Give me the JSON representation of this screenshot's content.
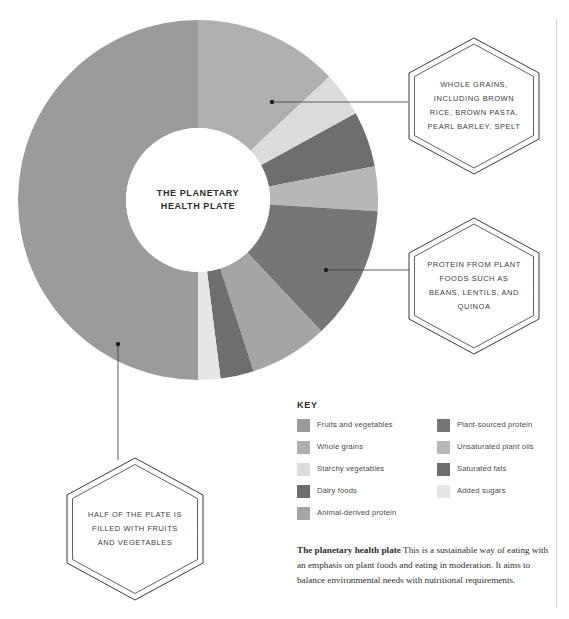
{
  "page": {
    "center_label": "THE PLANETARY\nHEALTH PLATE"
  },
  "callouts": [
    {
      "id": "whole-grains",
      "text": "WHOLE GRAINS,\nINCLUDING BROWN\nRICE, BROWN PASTA,\nPEARL BARLEY, SPELT"
    },
    {
      "id": "plant-protein",
      "text": "PROTEIN FROM PLANT\nFOODS SUCH AS\nBEANS, LENTILS, AND\nQUINOA"
    },
    {
      "id": "fruits-vegetables",
      "text": "HALF OF THE PLATE IS\nFILLED WITH FRUITS\nAND VEGETABLES"
    }
  ],
  "key": {
    "title": "KEY",
    "left_column": [
      {
        "label": "Fruits and vegetables",
        "color": "#9b9b9b"
      },
      {
        "label": "Whole grains",
        "color": "#b0b0b0"
      },
      {
        "label": "Starchy vegetables",
        "color": "#dcdcdc"
      },
      {
        "label": "Dairy foods",
        "color": "#6e6e6e"
      },
      {
        "label": "Animal-derived protein",
        "color": "#a5a5a5"
      }
    ],
    "right_column": [
      {
        "label": "Plant-sourced protein",
        "color": "#767676"
      },
      {
        "label": "Unsaturated plant oils",
        "color": "#b7b7b7"
      },
      {
        "label": "Saturated fats",
        "color": "#6e6e6e"
      },
      {
        "label": "Added sugars",
        "color": "#e6e6e6"
      }
    ]
  },
  "caption": {
    "lead": "The planetary health plate",
    "body": "This is a sustainable way of eating with an emphasis on plant foods and eating in moderation. It aims to balance environmental needs with nutritional requirements."
  },
  "chart_data": {
    "type": "pie",
    "title": "The planetary health plate",
    "subtitle": "",
    "xlabel": "",
    "ylabel": "",
    "donut": true,
    "inner_radius_ratio": 0.4,
    "start_angle_deg": 0,
    "direction": "clockwise",
    "legend_position": "bottom-right",
    "grid": false,
    "units": "percent of plate",
    "categories": [
      "Whole grains",
      "Starchy vegetables",
      "Dairy foods",
      "Unsaturated plant oils",
      "Plant-sourced protein",
      "Animal-derived protein",
      "Saturated fats",
      "Added sugars",
      "Fruits and vegetables"
    ],
    "values": [
      13,
      4,
      5,
      4,
      12,
      7,
      3,
      2,
      50
    ],
    "colors": [
      "#b0b0b0",
      "#dcdcdc",
      "#6e6e6e",
      "#b7b7b7",
      "#767676",
      "#a5a5a5",
      "#6e6e6e",
      "#e6e6e6",
      "#9b9b9b"
    ],
    "annotations": [
      "WHOLE GRAINS, INCLUDING BROWN RICE, BROWN PASTA, PEARL BARLEY, SPELT",
      "PROTEIN FROM PLANT FOODS SUCH AS BEANS, LENTILS, AND QUINOA",
      "HALF OF THE PLATE IS FILLED WITH FRUITS AND VEGETABLES"
    ]
  }
}
